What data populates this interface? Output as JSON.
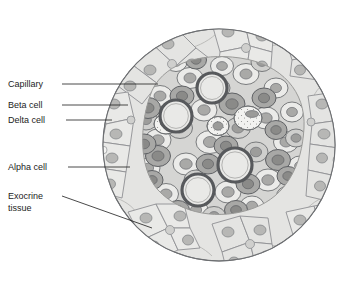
{
  "figure": {
    "canvas": {
      "width": 340,
      "height": 282
    }
  },
  "labels": [
    {
      "id": "capillary",
      "text": "Capillary",
      "text2": "",
      "x": 8,
      "y": 87,
      "leader": {
        "type": "line",
        "x1": 62,
        "y1": 84,
        "x2": 158,
        "y2": 84
      }
    },
    {
      "id": "beta-cell",
      "text": "Beta cell",
      "text2": "",
      "x": 8,
      "y": 108,
      "leader": {
        "type": "line",
        "x1": 62,
        "y1": 105,
        "x2": 128,
        "y2": 105
      }
    },
    {
      "id": "delta-cell",
      "text": "Delta cell",
      "text2": "",
      "x": 8,
      "y": 123,
      "leader": {
        "type": "line",
        "x1": 66,
        "y1": 120,
        "x2": 112,
        "y2": 120
      }
    },
    {
      "id": "alpha-cell",
      "text": "Alpha cell",
      "text2": "",
      "x": 8,
      "y": 170,
      "leader": {
        "type": "line",
        "x1": 68,
        "y1": 167,
        "x2": 130,
        "y2": 167
      }
    },
    {
      "id": "exocrine-tissue",
      "text": "Exocrine",
      "text2": "tissue",
      "x": 8,
      "y": 199,
      "leader": {
        "type": "line",
        "x1": 62,
        "y1": 196,
        "x2": 152,
        "y2": 228
      }
    }
  ],
  "colors": {
    "background": "#ffffff",
    "outline": "#6d6f72",
    "label_text": "#1c1c1c",
    "leader_line": "#1c1c1c",
    "exocrine_fill": "#e4e4e2",
    "exocrine_nucleus": "#b7b7b5",
    "beta_fill": "#ebebe9",
    "beta_nucleus": "#a9a9a7",
    "alpha_fill": "#a8a8a6",
    "alpha_nucleus": "#8a8a88",
    "delta_fill": "#f2f2f0",
    "delta_nucleus": "#9b9b99",
    "mid_fill": "#cfcfcd",
    "mid_nucleus": "#9d9d9b",
    "capillary_ring": "#57595c",
    "capillary_lumen": "#e9e9e7",
    "stroma": "#bcbcba"
  },
  "structures": {
    "islet_center": {
      "cx": 219,
      "cy": 145
    },
    "islet_radius": 116,
    "capillaries": [
      {
        "cx": 212,
        "cy": 88,
        "r": 15
      },
      {
        "cx": 176,
        "cy": 116,
        "r": 16
      },
      {
        "cx": 198,
        "cy": 190,
        "r": 16
      },
      {
        "cx": 235,
        "cy": 165,
        "r": 17
      }
    ],
    "cell_type_counts": {
      "beta": 44,
      "alpha": 18,
      "delta": 6,
      "capillary": 4
    }
  }
}
